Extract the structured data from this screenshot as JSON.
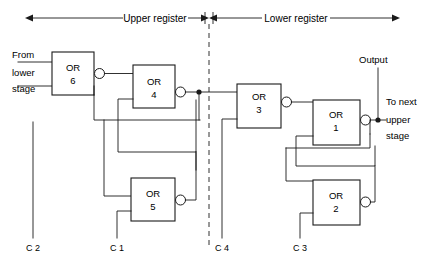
{
  "diagram": {
    "colors": {
      "line": "#1a1a1a",
      "text": "#000000",
      "background": "#ffffff"
    },
    "spans": [
      {
        "id": "upper",
        "label": "Upper register"
      },
      {
        "id": "lower",
        "label": "Lower register"
      }
    ],
    "gates": [
      {
        "id": "or6",
        "type": "OR",
        "number": "6"
      },
      {
        "id": "or4",
        "type": "OR",
        "number": "4"
      },
      {
        "id": "or5",
        "type": "OR",
        "number": "5"
      },
      {
        "id": "or3",
        "type": "OR",
        "number": "3"
      },
      {
        "id": "or1",
        "type": "OR",
        "number": "1"
      },
      {
        "id": "or2",
        "type": "OR",
        "number": "2"
      }
    ],
    "io_labels": {
      "input_line1": "From",
      "input_line2": "lower",
      "input_line3": "stage",
      "output": "Output",
      "next_line1": "To next",
      "next_line2": "upper",
      "next_line3": "stage"
    },
    "control_lines": [
      {
        "id": "c2",
        "label": "C 2"
      },
      {
        "id": "c1",
        "label": "C 1"
      },
      {
        "id": "c4",
        "label": "C 4"
      },
      {
        "id": "c3",
        "label": "C 3"
      }
    ]
  }
}
